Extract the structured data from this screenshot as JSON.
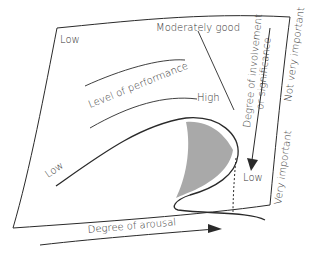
{
  "diagram": {
    "labels": {
      "top_left_low": "Low",
      "moderately_good": "Moderately good",
      "level_of_performance": "Level of performance",
      "high": "High",
      "curve_low": "Low",
      "involvement_line1": "Degree of involvement",
      "involvement_line2": "or significance",
      "not_very_important": "Not very important",
      "very_important": "Very important",
      "bottom_low": "Low",
      "degree_of_arousal": "Degree of arousal"
    },
    "colors": {
      "line": "#2a2a2a",
      "shade": "#a9a9a9",
      "background": "#ffffff"
    }
  }
}
